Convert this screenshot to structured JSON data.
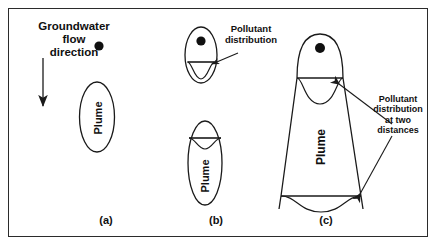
{
  "figure": {
    "border_color": "#2b2b2b",
    "stroke_color": "#1a1a1a",
    "background": "#ffffff"
  },
  "annotations": {
    "flow_label": "Groundwater\nflow\ndirection",
    "pollutant_label_b": "Pollutant\ndistribution",
    "pollutant_label_c": "Pollutant\ndistribution\nat two\ndistances"
  },
  "panels": [
    {
      "id": "a",
      "caption": "(a)",
      "plume_label": "Plume",
      "shape": "ellipse",
      "source_dot": true,
      "distribution_curves": 0
    },
    {
      "id": "b",
      "caption": "(b)",
      "plume_label": "Plume",
      "shape": "two-ellipses",
      "source_dot": true,
      "distribution_curves": 2
    },
    {
      "id": "c",
      "caption": "(c)",
      "plume_label": "Plume",
      "shape": "cone",
      "source_dot": true,
      "distribution_curves": 2
    }
  ],
  "arrows": {
    "flow_arrow": "downward",
    "callout_b": 1,
    "callout_c": 2
  }
}
